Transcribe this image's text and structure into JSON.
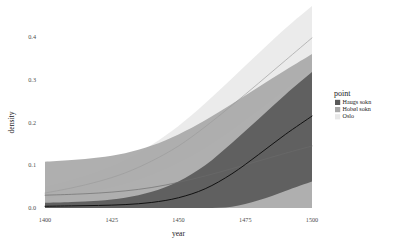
{
  "chart_data": {
    "type": "line",
    "title": "",
    "xlabel": "year",
    "ylabel": "density",
    "xlim": [
      1400,
      1500
    ],
    "ylim": [
      0.0,
      0.44
    ],
    "xticks": [
      1400,
      1425,
      1450,
      1475,
      1500
    ],
    "xtick_labels": [
      "1400",
      "1425",
      "1450",
      "1475",
      "1500"
    ],
    "yticks": [
      0.0,
      0.1,
      0.2,
      0.3,
      0.4
    ],
    "ytick_labels": [
      "0.0",
      "0.1",
      "0.2",
      "0.3",
      "0.4"
    ],
    "grid": false,
    "legend_position": "right",
    "legend_title": "point",
    "x": [
      1400,
      1410,
      1420,
      1430,
      1440,
      1450,
      1460,
      1470,
      1480,
      1490,
      1500
    ],
    "series": [
      {
        "name": "Haugs sokn",
        "color": "#595959",
        "line_color": "#111111",
        "ribbon_color": "#595959",
        "values": [
          0.004,
          0.005,
          0.006,
          0.008,
          0.013,
          0.024,
          0.045,
          0.08,
          0.125,
          0.172,
          0.215
        ],
        "lower": [
          0.0,
          0.0,
          0.0,
          0.0,
          0.0,
          0.0,
          0.0,
          0.003,
          0.018,
          0.04,
          0.062
        ],
        "upper": [
          0.012,
          0.014,
          0.017,
          0.024,
          0.038,
          0.062,
          0.1,
          0.152,
          0.208,
          0.265,
          0.318
        ]
      },
      {
        "name": "Hobøl sokn",
        "color": "#a8a8a8",
        "line_color": "#6b6b6b",
        "ribbon_color": "#a8a8a8",
        "values": [
          0.03,
          0.032,
          0.035,
          0.04,
          0.048,
          0.06,
          0.075,
          0.092,
          0.11,
          0.128,
          0.145
        ],
        "lower": [
          0.0,
          0.0,
          0.0,
          0.0,
          0.0,
          0.0,
          0.0,
          0.0,
          0.0,
          0.0,
          0.0
        ],
        "upper": [
          0.108,
          0.112,
          0.118,
          0.128,
          0.146,
          0.172,
          0.205,
          0.243,
          0.283,
          0.322,
          0.36
        ]
      },
      {
        "name": "Oslo",
        "color": "#e8e8e8",
        "line_color": "#9a9a9a",
        "ribbon_color": "#e8e8e8",
        "values": [
          0.035,
          0.047,
          0.062,
          0.082,
          0.11,
          0.145,
          0.19,
          0.24,
          0.292,
          0.345,
          0.398
        ],
        "lower": [
          0.022,
          0.03,
          0.041,
          0.056,
          0.077,
          0.105,
          0.14,
          0.182,
          0.228,
          0.276,
          0.325
        ],
        "upper": [
          0.05,
          0.066,
          0.086,
          0.112,
          0.148,
          0.192,
          0.245,
          0.303,
          0.362,
          0.42,
          0.478
        ]
      }
    ],
    "legend_entries": [
      {
        "label": "Haugs sokn",
        "swatch": "#595959"
      },
      {
        "label": "Hobøl sokn",
        "swatch": "#a8a8a8"
      },
      {
        "label": "Oslo",
        "swatch": "#e8e8e8"
      }
    ]
  },
  "panel": {
    "background": "#ffffff",
    "axis_text_color": "#4d4d4d",
    "axis_title_color": "#1a1a1a"
  }
}
